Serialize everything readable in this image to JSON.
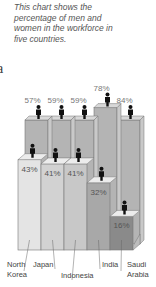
{
  "caption": "This chart shows the percentage of men and women in the workforce in five countries.",
  "edge_text": "a",
  "chart_data": {
    "type": "bar",
    "subtype": "stacked-3d-pictogram",
    "title": "This chart shows the percentage of men and women in the workforce in five countries.",
    "categories": [
      "North Korea",
      "Japan",
      "Indonesia",
      "India",
      "Saudi Arabia"
    ],
    "category_lines": [
      [
        "North",
        "Korea"
      ],
      [
        "Japan"
      ],
      [
        "Indonesia"
      ],
      [
        "India"
      ],
      [
        "Saudi",
        "Arabia"
      ]
    ],
    "series": [
      {
        "name": "Men",
        "values": [
          57,
          59,
          59,
          78,
          84
        ],
        "labels": [
          "57%",
          "59%",
          "59%",
          "78%",
          "84%"
        ],
        "color": "#b4b4b4"
      },
      {
        "name": "Women",
        "values": [
          43,
          41,
          41,
          32,
          16
        ],
        "labels": [
          "43%",
          "41%",
          "41%",
          "32%",
          "16%"
        ],
        "colors": [
          "#e4e4e4",
          "#d2d2d2",
          "#c8c8c8",
          "#a8a8a8",
          "#8a8a8a"
        ]
      }
    ],
    "ylim": [
      0,
      100
    ],
    "xlabel": "",
    "ylabel": "",
    "grid": false,
    "legend": "none",
    "icon": "person-icon"
  }
}
